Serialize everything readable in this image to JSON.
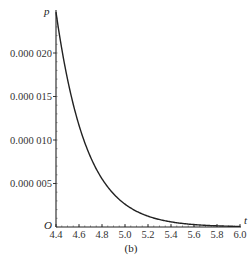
{
  "chart_data": {
    "type": "line",
    "title": "",
    "caption": "(b)",
    "xlabel": "t",
    "ylabel": "p",
    "origin_label": "O",
    "xlim": [
      4.4,
      6.0
    ],
    "ylim": [
      0,
      2.55e-05
    ],
    "grid": false,
    "legend": null,
    "x_ticks": [
      4.4,
      4.6,
      4.8,
      5.0,
      5.2,
      5.4,
      5.6,
      5.8,
      6.0
    ],
    "x_tick_labels": [
      "4.4",
      "4.6",
      "4.8",
      "5.0",
      "5.2",
      "5.4",
      "5.6",
      "5.8",
      "6.0"
    ],
    "y_ticks": [
      5e-06,
      1e-05,
      1.5e-05,
      2e-05
    ],
    "y_tick_labels": [
      "0.000 005",
      "0.000 010",
      "0.000 015",
      "0.000 020"
    ],
    "series": [
      {
        "name": "p(t)",
        "color": "#222222",
        "x": [
          4.4,
          4.45,
          4.5,
          4.55,
          4.6,
          4.65,
          4.7,
          4.75,
          4.8,
          4.85,
          4.9,
          4.95,
          5.0,
          5.1,
          5.2,
          5.3,
          5.4,
          5.5,
          5.6,
          5.7,
          5.8,
          5.9,
          6.0
        ],
        "y": [
          2.47e-05,
          2.05e-05,
          1.7e-05,
          1.41e-05,
          1.17e-05,
          9.7e-06,
          8e-06,
          6.6e-06,
          5.4e-06,
          4.4e-06,
          3.6e-06,
          2.9e-06,
          2.3e-06,
          1.4e-06,
          8e-07,
          4.5e-07,
          2.5e-07,
          1.2e-07,
          6e-08,
          3e-08,
          1e-08,
          5e-09,
          2e-09
        ]
      }
    ]
  }
}
